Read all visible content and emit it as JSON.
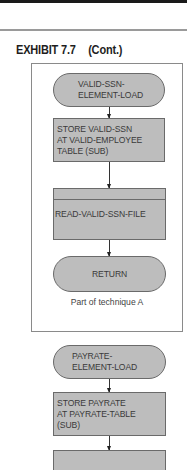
{
  "header": {
    "exhibit": "EXHIBIT 7.7",
    "continued": "(Cont.)"
  },
  "flowchart_a": {
    "start": "VALID-SSN-\nELEMENT-LOAD",
    "process": "STORE VALID-SSN\nAT VALID-EMPLOYEE\nTABLE (SUB)",
    "predefined": "READ-VALID-SSN-FILE",
    "end": "RETURN",
    "caption": "Part of technique A"
  },
  "flowchart_b": {
    "start": "PAYRATE-\nELEMENT-LOAD",
    "process": "STORE PAYRATE\nAT PAYRATE-TABLE\n(SUB)"
  },
  "colors": {
    "shape_fill": "#bdbdbd",
    "shape_border": "#6a6a6a",
    "text": "#3a3a3a"
  }
}
